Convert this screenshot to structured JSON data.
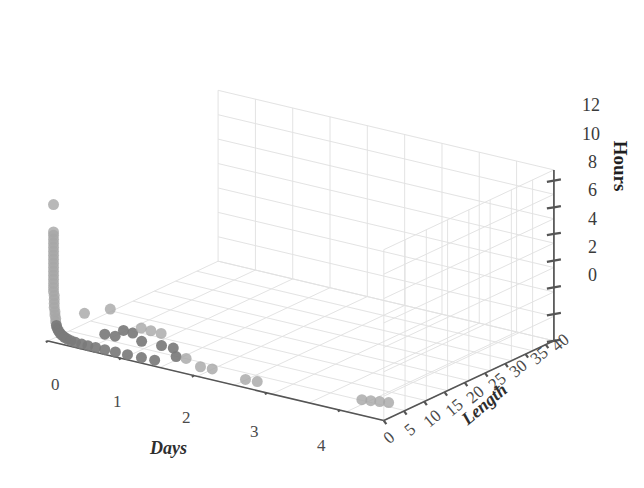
{
  "figure": {
    "background_color": "#ffffff",
    "grid_color": "#e2e2e2",
    "axis_line_color": "#555555",
    "point_color_light": "#a6a6a6",
    "point_color_dark": "#7b7b7b"
  },
  "axes": {
    "x": {
      "title": "Days",
      "ticks": [
        "0",
        "1",
        "2",
        "3",
        "4"
      ],
      "values": [
        0,
        1,
        2,
        3,
        4
      ],
      "range": [
        0,
        4.6
      ]
    },
    "y": {
      "title": "Length",
      "ticks": [
        "0",
        "5",
        "10",
        "15",
        "20",
        "25",
        "30",
        "35",
        "40"
      ],
      "values": [
        0,
        5,
        10,
        15,
        20,
        25,
        30,
        35,
        40
      ],
      "range": [
        0,
        42
      ]
    },
    "z": {
      "title": "Hours",
      "ticks": [
        "0",
        "2",
        "4",
        "6",
        "8",
        "10",
        "12"
      ],
      "values": [
        0,
        2,
        4,
        6,
        8,
        10,
        12
      ],
      "range": [
        0,
        12.8
      ]
    }
  },
  "chart_data": {
    "type": "scatter",
    "title": "",
    "xlabel": "Days",
    "ylabel": "Length",
    "zlabel": "Hours",
    "xlim": [
      0,
      4.6
    ],
    "ylim": [
      0,
      42
    ],
    "zlim": [
      0,
      12.8
    ],
    "grid": true,
    "legend": "none",
    "projection": "3d",
    "marker_size_px": 11,
    "series": [
      {
        "name": "observations",
        "color": "#a6a6a6",
        "points": [
          {
            "x": 0.02,
            "y": 1.0,
            "z": 10.1
          },
          {
            "x": 0.02,
            "y": 1.0,
            "z": 8.05
          },
          {
            "x": 0.02,
            "y": 1.0,
            "z": 7.8
          },
          {
            "x": 0.02,
            "y": 1.0,
            "z": 7.5
          },
          {
            "x": 0.02,
            "y": 1.0,
            "z": 7.2
          },
          {
            "x": 0.02,
            "y": 1.0,
            "z": 6.9
          },
          {
            "x": 0.02,
            "y": 1.0,
            "z": 6.6
          },
          {
            "x": 0.02,
            "y": 1.0,
            "z": 6.3
          },
          {
            "x": 0.02,
            "y": 1.0,
            "z": 6.0
          },
          {
            "x": 0.02,
            "y": 1.0,
            "z": 5.7
          },
          {
            "x": 0.02,
            "y": 1.0,
            "z": 5.4
          },
          {
            "x": 0.02,
            "y": 1.0,
            "z": 5.1
          },
          {
            "x": 0.02,
            "y": 1.0,
            "z": 4.8
          },
          {
            "x": 0.02,
            "y": 1.0,
            "z": 4.5
          },
          {
            "x": 0.02,
            "y": 1.0,
            "z": 4.2
          },
          {
            "x": 0.02,
            "y": 1.0,
            "z": 3.9
          },
          {
            "x": 0.02,
            "y": 1.0,
            "z": 3.6
          },
          {
            "x": 0.03,
            "y": 1.0,
            "z": 3.3
          },
          {
            "x": 0.03,
            "y": 1.0,
            "z": 3.0
          },
          {
            "x": 0.03,
            "y": 1.0,
            "z": 2.7
          },
          {
            "x": 0.03,
            "y": 1.0,
            "z": 2.4
          },
          {
            "x": 0.04,
            "y": 1.0,
            "z": 2.1
          },
          {
            "x": 0.04,
            "y": 1.0,
            "z": 1.85
          },
          {
            "x": 0.05,
            "y": 1.0,
            "z": 1.6
          },
          {
            "x": 0.05,
            "y": 1.0,
            "z": 1.35
          },
          {
            "x": 0.06,
            "y": 1.0,
            "z": 1.1
          },
          {
            "x": 0.07,
            "y": 1.0,
            "z": 0.9
          },
          {
            "x": 0.09,
            "y": 1.0,
            "z": 0.72
          },
          {
            "x": 0.11,
            "y": 1.0,
            "z": 0.58
          },
          {
            "x": 0.14,
            "y": 1.0,
            "z": 0.46
          },
          {
            "x": 0.17,
            "y": 1.0,
            "z": 0.36
          },
          {
            "x": 0.21,
            "y": 1.0,
            "z": 0.28
          },
          {
            "x": 0.26,
            "y": 1.0,
            "z": 0.22
          },
          {
            "x": 0.32,
            "y": 1.0,
            "z": 0.17
          },
          {
            "x": 0.4,
            "y": 1.1,
            "z": 0.13
          },
          {
            "x": 0.48,
            "y": 1.2,
            "z": 0.1
          },
          {
            "x": 0.58,
            "y": 1.3,
            "z": 0.08
          },
          {
            "x": 0.7,
            "y": 1.4,
            "z": 0.06
          },
          {
            "x": 0.84,
            "y": 1.5,
            "z": 0.05
          },
          {
            "x": 1.0,
            "y": 1.6,
            "z": 0.04
          },
          {
            "x": 1.18,
            "y": 1.8,
            "z": 0.03
          },
          {
            "x": 1.35,
            "y": 2.0,
            "z": 0.03
          },
          {
            "x": 0.3,
            "y": 3.6,
            "z": 1.95
          },
          {
            "x": 0.62,
            "y": 4.2,
            "z": 2.6
          },
          {
            "x": 1.0,
            "y": 5.0,
            "z": 1.55
          },
          {
            "x": 1.12,
            "y": 5.2,
            "z": 1.48
          },
          {
            "x": 1.25,
            "y": 5.4,
            "z": 1.42
          },
          {
            "x": 0.74,
            "y": 5.3,
            "z": 1.0
          },
          {
            "x": 0.85,
            "y": 5.6,
            "z": 0.9
          },
          {
            "x": 0.5,
            "y": 5.0,
            "z": 0.45
          },
          {
            "x": 0.62,
            "y": 5.4,
            "z": 0.4
          },
          {
            "x": 0.95,
            "y": 6.0,
            "z": 0.35
          },
          {
            "x": 1.2,
            "y": 6.4,
            "z": 0.3
          },
          {
            "x": 1.35,
            "y": 6.6,
            "z": 0.28
          },
          {
            "x": 1.5,
            "y": 4.6,
            "z": 0.12
          },
          {
            "x": 1.62,
            "y": 4.9,
            "z": 0.1
          },
          {
            "x": 1.9,
            "y": 3.4,
            "z": 0.05
          },
          {
            "x": 2.05,
            "y": 3.6,
            "z": 0.05
          },
          {
            "x": 2.55,
            "y": 2.8,
            "z": 0.03
          },
          {
            "x": 2.7,
            "y": 3.0,
            "z": 0.03
          },
          {
            "x": 4.0,
            "y": 5.4,
            "z": 0.02
          },
          {
            "x": 4.1,
            "y": 5.8,
            "z": 0.02
          },
          {
            "x": 4.2,
            "y": 6.2,
            "z": 0.02
          },
          {
            "x": 4.3,
            "y": 6.6,
            "z": 0.02
          }
        ]
      }
    ]
  }
}
